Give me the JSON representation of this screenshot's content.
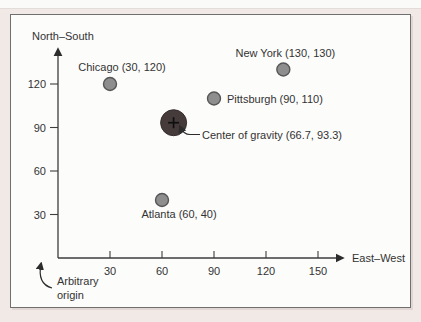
{
  "chart_data": {
    "type": "scatter",
    "title": "",
    "xlabel": "East–West",
    "ylabel": "North–South",
    "xlim": [
      0,
      165
    ],
    "ylim": [
      0,
      145
    ],
    "x_ticks": [
      "30",
      "60",
      "90",
      "120",
      "150"
    ],
    "y_ticks": [
      "30",
      "60",
      "90",
      "120"
    ],
    "grid": false,
    "points": [
      {
        "name": "Chicago",
        "x": 30,
        "y": 120,
        "label": "Chicago (30, 120)"
      },
      {
        "name": "New York",
        "x": 130,
        "y": 130,
        "label": "New York (130, 130)"
      },
      {
        "name": "Pittsburgh",
        "x": 90,
        "y": 110,
        "label": "Pittsburgh (90, 110)"
      },
      {
        "name": "Atlanta",
        "x": 60,
        "y": 40,
        "label": "Atlanta (60, 40)"
      }
    ],
    "center_of_gravity": {
      "x": 66.7,
      "y": 93.3,
      "label": "Center of gravity (66.7, 93.3)"
    },
    "annotations": {
      "origin_line1": "Arbitrary",
      "origin_line2": "origin"
    },
    "colors": {
      "city_fill": "#8e8e8e",
      "city_stroke": "#565656",
      "cog_fill": "#453b3b",
      "cross": "#101010",
      "axis": "#3d3d3d",
      "text": "#333333",
      "frame_border": "#6f6f6f",
      "page_bg": "#f0e9e6",
      "chart_bg": "#fcfcfb"
    }
  }
}
